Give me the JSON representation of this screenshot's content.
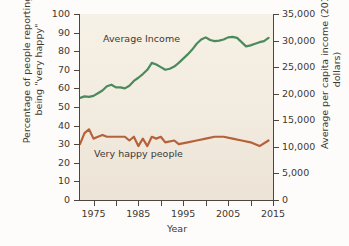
{
  "chart_data": {
    "type": "line",
    "title": "",
    "xlabel": "Year",
    "ylabel": "Percentage of people reporting being \"very happy\"",
    "ylabel_right": "Average per capita income (2015 dollars)",
    "grid": false,
    "legend_position": "inline-annotation",
    "xlim": [
      1972,
      2015
    ],
    "xticks_major": [
      1975,
      1985,
      1995,
      2005,
      2015
    ],
    "xticks_minor": [
      1975,
      1980,
      1985,
      1990,
      1995,
      2000,
      2005,
      2010,
      2015
    ],
    "ylim_left": [
      0,
      100
    ],
    "yticks_left": [
      0,
      10,
      20,
      30,
      40,
      50,
      60,
      70,
      80,
      90,
      100
    ],
    "yticklabels_left": [
      "0",
      "10",
      "20",
      "30",
      "40",
      "50",
      "60",
      "70",
      "80",
      "90",
      "100"
    ],
    "ylim_right": [
      0,
      35000
    ],
    "yticks_right": [
      0,
      5000,
      10000,
      15000,
      20000,
      25000,
      30000,
      35000
    ],
    "yticklabels_right": [
      "0",
      "5,000",
      "10,000",
      "15,000",
      "20,000",
      "25,000",
      "30,000",
      "35,000"
    ],
    "colors": {
      "average_income": "#4a8a5c",
      "very_happy_people": "#b5623a",
      "plot_background": "#f2ebdf",
      "axis": "#4d4640",
      "text": "#3d3833"
    },
    "series": [
      {
        "name": "Average Income",
        "axis": "right",
        "color": "#4a8a5c",
        "units": "2015 dollars per capita",
        "x": [
          1972,
          1973,
          1974,
          1975,
          1976,
          1977,
          1978,
          1979,
          1980,
          1981,
          1982,
          1983,
          1984,
          1985,
          1986,
          1987,
          1988,
          1989,
          1990,
          1991,
          1992,
          1993,
          1994,
          1995,
          1996,
          1997,
          1998,
          1999,
          2000,
          2001,
          2002,
          2003,
          2004,
          2005,
          2006,
          2007,
          2008,
          2009,
          2010,
          2011,
          2012,
          2013,
          2014
        ],
        "values": [
          19200,
          19500,
          19400,
          19600,
          20100,
          20600,
          21400,
          21700,
          21200,
          21200,
          21000,
          21500,
          22400,
          23000,
          23700,
          24500,
          25800,
          25500,
          25000,
          24500,
          24700,
          25100,
          25800,
          26600,
          27400,
          28300,
          29400,
          30200,
          30600,
          30100,
          29900,
          30000,
          30200,
          30600,
          30700,
          30500,
          29700,
          28900,
          29100,
          29400,
          29700,
          29900,
          30500
        ]
      },
      {
        "name": "Very happy people",
        "axis": "left",
        "color": "#b5623a",
        "units": "percent",
        "x": [
          1972,
          1973,
          1974,
          1975,
          1976,
          1977,
          1978,
          1980,
          1982,
          1983,
          1984,
          1985,
          1986,
          1987,
          1988,
          1989,
          1990,
          1991,
          1993,
          1994,
          1996,
          1998,
          2000,
          2002,
          2004,
          2006,
          2008,
          2010,
          2012,
          2014
        ],
        "values": [
          30,
          36,
          38,
          33,
          34,
          35,
          34,
          34,
          34,
          32,
          34,
          29,
          33,
          29,
          34,
          33,
          34,
          31,
          32,
          30,
          31,
          32,
          33,
          34,
          34,
          33,
          32,
          31,
          29,
          32
        ]
      }
    ],
    "annotations": [
      {
        "text": "Average Income",
        "series": "Average Income"
      },
      {
        "text": "Very happy people",
        "series": "Very happy people"
      }
    ]
  },
  "axes": {
    "left": {
      "title": "Percentage of people reporting being \"very happy\""
    },
    "right": {
      "title": "Average per capita income (2015 dollars)"
    },
    "bottom": {
      "title": "Year"
    }
  }
}
